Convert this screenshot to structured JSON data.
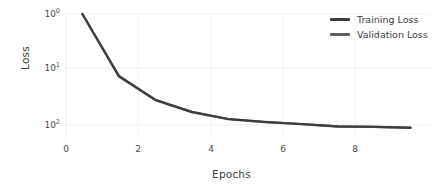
{
  "chart_data": {
    "type": "line",
    "title": "",
    "xlabel": "Epochs",
    "ylabel": "Loss",
    "yscale": "log",
    "grid": true,
    "legend_position": "top-right",
    "xlim": [
      -0.45,
      9.45
    ],
    "xticks": [
      0,
      2,
      4,
      6,
      8
    ],
    "xtick_labels": [
      "0",
      "2",
      "4",
      "6",
      "8"
    ],
    "yticks": [
      1,
      10,
      100
    ],
    "ytick_labels": [
      "10⁰",
      "10¹",
      "10²"
    ],
    "ytick_bases": [
      "10",
      "10",
      "10"
    ],
    "ytick_exponents": [
      "0",
      "1",
      "2"
    ],
    "x": [
      0,
      1,
      2,
      3,
      4,
      5,
      6,
      7,
      8,
      9
    ],
    "series": [
      {
        "name": "Training Loss",
        "color": "#3d3d3d",
        "values": [
          1.0,
          13.0,
          35.0,
          58.0,
          78.0,
          88.0,
          96.0,
          106.0,
          108.0,
          112.0
        ]
      },
      {
        "name": "Validation Loss",
        "color": "#5c5c5c",
        "values": [
          1.0,
          13.4,
          35.6,
          58.6,
          78.6,
          88.6,
          96.6,
          106.4,
          108.4,
          112.4
        ]
      }
    ]
  },
  "legend": {
    "items": [
      {
        "label": "Training Loss",
        "color": "#3d3d3d"
      },
      {
        "label": "Validation Loss",
        "color": "#5c5c5c"
      }
    ]
  },
  "axes": {
    "x_label": "Epochs",
    "y_label": "Loss"
  },
  "style": {
    "background": "#ffffff",
    "grid_color": "#efefef",
    "text_color": "#3b3b3b",
    "tick_color": "#4a4a4a"
  }
}
